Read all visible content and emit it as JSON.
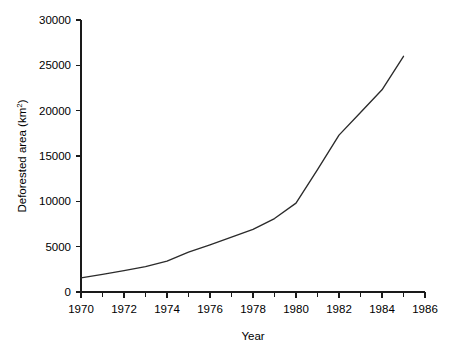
{
  "chart_data": {
    "type": "line",
    "title": "",
    "xlabel": "Year",
    "ylabel": "Deforested area (km2)",
    "ylabel_base": "Deforested area (km",
    "ylabel_sup": "2",
    "ylabel_tail": ")",
    "xlim": [
      1970,
      1986
    ],
    "ylim": [
      0,
      30000
    ],
    "grid": false,
    "legend": null,
    "line_color": "#2b2b2b",
    "x": [
      1970,
      1971,
      1972,
      1973,
      1974,
      1975,
      1976,
      1977,
      1978,
      1979,
      1980,
      1981,
      1982,
      1983,
      1984,
      1985
    ],
    "values": [
      1550,
      1950,
      2350,
      2800,
      3400,
      4400,
      5200,
      6050,
      6900,
      8100,
      9800,
      13500,
      17300,
      19800,
      22300,
      26000
    ],
    "series": [
      {
        "name": "Deforested area",
        "values": [
          1550,
          1950,
          2350,
          2800,
          3400,
          4400,
          5200,
          6050,
          6900,
          8100,
          9800,
          13500,
          17300,
          19800,
          22300,
          26000
        ]
      }
    ],
    "x_ticks_major": [
      1970,
      1972,
      1974,
      1976,
      1978,
      1980,
      1982,
      1984,
      1986
    ],
    "x_tick_labels": [
      "1970",
      "1972",
      "1974",
      "1976",
      "1978",
      "1980",
      "1982",
      "1984",
      "1986"
    ],
    "x_ticks_minor": [
      1971,
      1973,
      1975,
      1977,
      1979,
      1981,
      1983,
      1985
    ],
    "y_ticks": [
      0,
      5000,
      10000,
      15000,
      20000,
      25000,
      30000
    ],
    "y_tick_labels": [
      "0",
      "5000",
      "10000",
      "15000",
      "20000",
      "25000",
      "30000"
    ]
  }
}
